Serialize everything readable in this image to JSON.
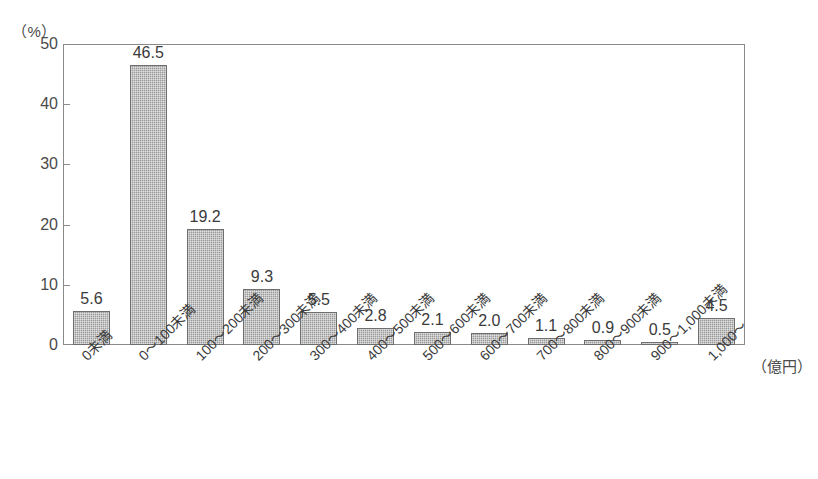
{
  "chart_data": {
    "type": "bar",
    "title": "",
    "subtitle": "",
    "xlabel": "（億円）",
    "ylabel": "（%）",
    "ylim": [
      0,
      50
    ],
    "ytick_values": [
      0,
      10,
      20,
      30,
      40,
      50
    ],
    "ytick_labels": [
      "0",
      "10",
      "20",
      "30",
      "40",
      "50"
    ],
    "grid": false,
    "legend": null,
    "categories": [
      "0未満",
      "0～100未満",
      "100～200未満",
      "200～300未満",
      "300～400未満",
      "400～500未満",
      "500～600未満",
      "600～700未満",
      "700～800未満",
      "800～900未満",
      "900～1,000未満",
      "1,000～"
    ],
    "values": [
      5.6,
      46.5,
      19.2,
      9.3,
      5.5,
      2.8,
      2.1,
      2.0,
      1.1,
      0.9,
      0.5,
      4.5
    ],
    "value_labels": [
      "5.6",
      "46.5",
      "19.2",
      "9.3",
      "5.5",
      "2.8",
      "2.1",
      "2.0",
      "1.1",
      "0.9",
      "0.5",
      "4.5"
    ],
    "bar_color": "#9a9a9a",
    "bar_edge_color": "#6e6e6e",
    "axis_color": "#8a8a8a",
    "text_color": "#3a3a3a"
  }
}
